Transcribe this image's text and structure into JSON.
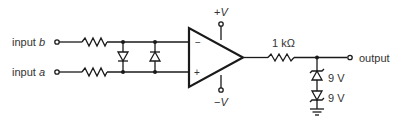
{
  "diagram": {
    "type": "op-amp comparator / clipping circuit schematic",
    "inputs": [
      {
        "id": "b",
        "label_prefix": "input",
        "label_var": "b",
        "op_amp_pin": "−"
      },
      {
        "id": "a",
        "label_prefix": "input",
        "label_var": "a",
        "op_amp_pin": "+"
      }
    ],
    "op_amp": {
      "minus_sign": "−",
      "plus_sign": "+",
      "pos_supply": {
        "sign": "+",
        "var": "V"
      },
      "neg_supply": {
        "sign": "−",
        "var": "V"
      }
    },
    "output_resistor": {
      "value": "1 kΩ"
    },
    "output_label": "output",
    "zeners": [
      {
        "value": "9 V"
      },
      {
        "value": "9 V"
      }
    ],
    "colors": {
      "line": "#1a1a1a",
      "text": "#333333",
      "background": "#ffffff"
    }
  }
}
